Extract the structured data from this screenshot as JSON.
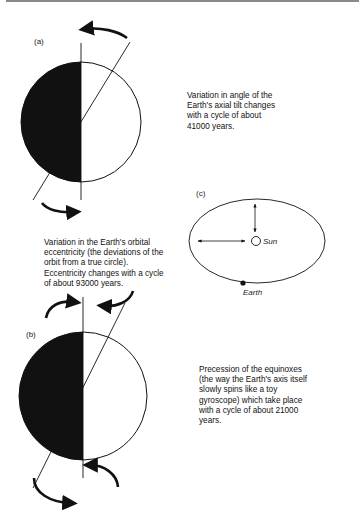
{
  "panels": {
    "a": {
      "label": "(a)",
      "description": "Variation in angle of the\nEarth's axial tilt changes\nwith a cycle of about\n41000 years."
    },
    "b": {
      "label": "(b)",
      "description": "Precession of the equinoxes\n(the way the Earth's axis itself\nslowly spins like a toy\ngyroscope) which take place\nwith a cycle of about 21000\nyears."
    },
    "c": {
      "label": "(c)",
      "description": "Variation in the Earth's orbital\neccentricity (the deviations of the\norbit from a true circle).\nEccentricity changes with a cycle\nof about 93000 years.",
      "sun_label": "Sun",
      "earth_label": "Earth"
    }
  },
  "colors": {
    "ink": "#111111",
    "paper": "#ffffff",
    "rule": "#8a8a8a"
  }
}
